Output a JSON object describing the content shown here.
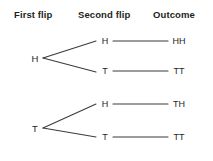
{
  "diagram": {
    "title_headers": {
      "first": "First flip",
      "second": "Second flip",
      "outcome": "Outcome"
    },
    "branches": [
      {
        "first_flip": "H",
        "children": [
          {
            "second_flip": "H",
            "outcome": "HH"
          },
          {
            "second_flip": "T",
            "outcome": "TT"
          }
        ]
      },
      {
        "first_flip": "T",
        "children": [
          {
            "second_flip": "H",
            "outcome": "TH"
          },
          {
            "second_flip": "T",
            "outcome": "TT"
          }
        ]
      }
    ],
    "colors": {
      "text": "#231f20",
      "line": "#3b3b3b",
      "background": "#ffffff"
    }
  }
}
